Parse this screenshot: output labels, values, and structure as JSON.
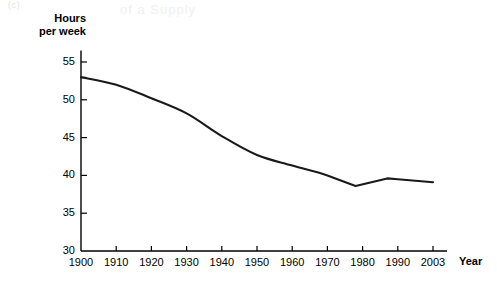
{
  "figure": {
    "label_fragment_top_left": "(c)",
    "faint_bleed_text": "of a Supply",
    "axis_title_y_line1": "Hours",
    "axis_title_y_line2": "per week",
    "axis_title_x": "Year",
    "line_color": "#1a1a1a",
    "axis_color": "#000000",
    "background_color": "#ffffff"
  },
  "chart_data": {
    "type": "line",
    "title": "",
    "xlabel": "Year",
    "ylabel": "Hours per week",
    "xlim": [
      1900,
      2003
    ],
    "ylim": [
      30,
      56
    ],
    "grid": false,
    "legend": null,
    "xticks": [
      "1900",
      "1910",
      "1920",
      "1930",
      "1940",
      "1950",
      "1960",
      "1970",
      "1980",
      "1990",
      "2003"
    ],
    "xtick_values": [
      1900,
      1910,
      1920,
      1930,
      1940,
      1950,
      1960,
      1970,
      1980,
      1990,
      2003
    ],
    "yticks": [
      "30",
      "35",
      "40",
      "45",
      "50",
      "55"
    ],
    "ytick_values": [
      30,
      35,
      40,
      45,
      50,
      55
    ],
    "series": [
      {
        "name": "Average hours worked per week",
        "x": [
          1900,
          1910,
          1920,
          1930,
          1940,
          1950,
          1960,
          1970,
          1978,
          1987,
          1990,
          2003
        ],
        "values": [
          53.0,
          52.0,
          50.2,
          48.2,
          45.2,
          42.7,
          41.3,
          40.0,
          38.6,
          39.6,
          39.5,
          39.1
        ]
      }
    ]
  }
}
